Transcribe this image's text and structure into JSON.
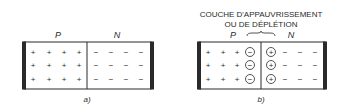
{
  "figure_a": {
    "label_p": "P",
    "label_n": "N",
    "caption": "a)",
    "p_charges": "+",
    "n_charges": "−",
    "rows": 3,
    "p_columns": 4,
    "n_columns": 4
  },
  "figure_b": {
    "title_line1": "COUCHE D'APPAUVRISSEMENT",
    "title_line2": "OU DE DÉPLÉTION",
    "label_p": "P",
    "label_n": "N",
    "caption": "b)",
    "p_charges": "+",
    "n_charges": "−",
    "depletion_p_ion": "−",
    "depletion_n_ion": "+",
    "rows": 3,
    "p_columns": 3,
    "n_columns": 3
  },
  "colors": {
    "ink": "#2a2a2a",
    "background": "#ffffff"
  }
}
